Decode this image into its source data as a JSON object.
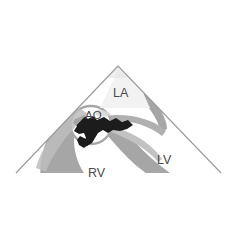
{
  "figure": {
    "name": "echocardiographic-sector-scan",
    "modality": "2D echocardiography sector image",
    "background_color": "#ffffff",
    "sector": {
      "apex_x": 118,
      "apex_y": 66,
      "left_end_x": 16,
      "left_end_y": 173,
      "right_end_x": 221,
      "right_end_y": 173,
      "outline_color": "#9a9a9a",
      "outline_width": 1.1
    },
    "palette": {
      "tissue_gray": "#a6a6a6",
      "tissue_gray_light": "#c9c9c9",
      "faint_gray": "#d8d8d8",
      "cavity_white": "#ffffff",
      "valve_black": "#1c1c1c",
      "label_gray": "#4a4a4a",
      "outline_gray": "#9a9a9a"
    }
  },
  "labels": [
    {
      "id": "la",
      "text": "LA",
      "meaning": "left atrium",
      "x": 113,
      "y": 97,
      "color": "#4a4a4a"
    },
    {
      "id": "ao",
      "text": "AO",
      "meaning": "aorta",
      "x": 85,
      "y": 119,
      "color": "#4a4a4a"
    },
    {
      "id": "rv",
      "text": "RV",
      "meaning": "right ventricle",
      "x": 88,
      "y": 177,
      "color": "#4a4a4a"
    },
    {
      "id": "lv",
      "text": "LV",
      "meaning": "left ventricle",
      "x": 157,
      "y": 164,
      "color": "#4a4a4a"
    }
  ],
  "structures": {
    "aortic_root_circle": {
      "name": "aortic-root",
      "cx": 91,
      "cy": 125,
      "rx": 20,
      "ry": 19,
      "fill": "#ffffff",
      "stroke": "#a6a6a6"
    },
    "aortic_valve_blob": {
      "name": "aortic-valve-cusps",
      "fill": "#1c1c1c"
    }
  }
}
